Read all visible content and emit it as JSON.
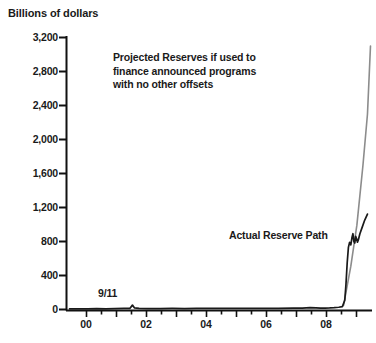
{
  "chart_data": {
    "type": "line",
    "title": "",
    "ylabel": "Billions of dollars",
    "xlabel": "",
    "ylim": [
      0,
      3200
    ],
    "xlim": [
      1999.5,
      2009.6
    ],
    "grid": false,
    "legend": "none",
    "ytick_labels": [
      "3,200",
      "2,800",
      "2,400",
      "2,000",
      "1,600",
      "1,200",
      "800",
      "400",
      "0"
    ],
    "ytick_values": [
      3200,
      2800,
      2400,
      2000,
      1600,
      1200,
      800,
      400,
      0
    ],
    "xtick_labels": [
      "00",
      "02",
      "04",
      "06",
      "08"
    ],
    "xtick_values": [
      2000,
      2002,
      2004,
      2006,
      2008
    ],
    "xminor_step": 0.5,
    "series": [
      {
        "name": "Actual Reserve Path",
        "color": "#1a1a1a",
        "points": [
          [
            1999.6,
            18
          ],
          [
            1999.9,
            20
          ],
          [
            2000.2,
            19
          ],
          [
            2000.5,
            21
          ],
          [
            2000.8,
            20
          ],
          [
            2001.1,
            22
          ],
          [
            2001.4,
            24
          ],
          [
            2001.6,
            26
          ],
          [
            2001.68,
            63
          ],
          [
            2001.75,
            30
          ],
          [
            2001.9,
            24
          ],
          [
            2002.2,
            22
          ],
          [
            2002.6,
            23
          ],
          [
            2003.0,
            24
          ],
          [
            2003.4,
            23
          ],
          [
            2003.8,
            25
          ],
          [
            2004.2,
            24
          ],
          [
            2004.6,
            26
          ],
          [
            2005.0,
            25
          ],
          [
            2005.4,
            26
          ],
          [
            2006.0,
            25
          ],
          [
            2006.5,
            26
          ],
          [
            2007.0,
            27
          ],
          [
            2007.3,
            28
          ],
          [
            2007.55,
            34
          ],
          [
            2007.75,
            30
          ],
          [
            2007.9,
            28
          ],
          [
            2008.05,
            29
          ],
          [
            2008.2,
            30
          ],
          [
            2008.35,
            33
          ],
          [
            2008.5,
            38
          ],
          [
            2008.62,
            45
          ],
          [
            2008.7,
            120
          ],
          [
            2008.74,
            310
          ],
          [
            2008.78,
            560
          ],
          [
            2008.82,
            740
          ],
          [
            2008.86,
            800
          ],
          [
            2008.9,
            770
          ],
          [
            2008.94,
            860
          ],
          [
            2008.97,
            900
          ],
          [
            2009.0,
            810
          ],
          [
            2009.03,
            790
          ],
          [
            2009.06,
            870
          ],
          [
            2009.09,
            840
          ],
          [
            2009.12,
            800
          ],
          [
            2009.15,
            830
          ],
          [
            2009.2,
            900
          ],
          [
            2009.28,
            980
          ],
          [
            2009.36,
            1060
          ],
          [
            2009.45,
            1130
          ]
        ]
      },
      {
        "name": "Projected Reserves",
        "color": "#8c8c8c",
        "points": [
          [
            2008.66,
            60
          ],
          [
            2008.9,
            520
          ],
          [
            2009.1,
            1000
          ],
          [
            2009.3,
            1700
          ],
          [
            2009.45,
            2300
          ],
          [
            2009.55,
            3100
          ]
        ]
      }
    ],
    "annotations": [
      {
        "name": "projected-reserves-note",
        "text": "Projected Reserves if used to\nfinance announced programs\nwith no other offsets"
      },
      {
        "name": "actual-reserve-path-label",
        "text": "Actual Reserve Path"
      },
      {
        "name": "nine-eleven-label",
        "text": "9/11"
      }
    ],
    "colors": {
      "actual": "#1a1a1a",
      "projected": "#8c8c8c",
      "axis": "#111111",
      "background": "#ffffff"
    }
  }
}
